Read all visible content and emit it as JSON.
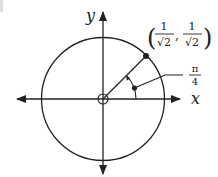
{
  "diagram": {
    "axes": {
      "x_label": "x",
      "y_label": "y"
    },
    "point": {
      "label_open": "(",
      "label_close": ")",
      "label_comma": ",",
      "x_num": "1",
      "x_den": "√2",
      "y_num": "1",
      "y_den": "√2"
    },
    "angle": {
      "num": "π",
      "den": "4"
    },
    "colors": {
      "stroke": "#222222",
      "background": "#ffffff"
    }
  }
}
